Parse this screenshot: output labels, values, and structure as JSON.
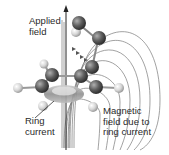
{
  "diagram": {
    "labels": {
      "applied_field": "Applied\nfield",
      "ring_current": "Ring\ncurrent",
      "induced_field": "Magnetic\nfield due to\nring current"
    },
    "icons": {
      "applied_field_arrow": "up-arrow",
      "carbon_atom": "dark-sphere",
      "hydrogen_atom": "light-sphere",
      "ring_current_torus": "ring"
    },
    "colors": {
      "carbon": "#5a5a5a",
      "hydrogen": "#d8d8d8",
      "field_lines": "#777777",
      "ring": "#9a9a9a",
      "text": "#2a2a2a"
    }
  }
}
